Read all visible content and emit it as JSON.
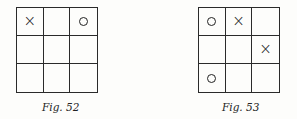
{
  "figures": [
    {
      "caption": "Fig. 52",
      "cells": [
        "X",
        "",
        "O",
        "",
        "",
        "",
        "",
        "",
        ""
      ]
    },
    {
      "caption": "Fig. 53",
      "cells": [
        "O",
        "X",
        "",
        "",
        "",
        "X",
        "O",
        "",
        ""
      ]
    }
  ],
  "symbols": {
    "X": "×",
    "O": "o"
  }
}
